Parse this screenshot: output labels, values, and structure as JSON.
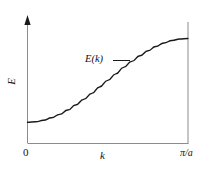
{
  "figure": {
    "kind": "dispersion-curve",
    "background_color": "#ffffff",
    "line_color": "#1a1a1a",
    "axis_color": "#808080"
  },
  "labels": {
    "y_axis": "E",
    "x_axis": "k",
    "origin": "0",
    "x_max": "π/a",
    "curve_annotation": "E(k)"
  },
  "chart_data": {
    "type": "line",
    "title": "",
    "xlabel": "k",
    "ylabel": "E",
    "xlim": [
      0,
      3.14159
    ],
    "ylim": [
      0,
      1
    ],
    "xtick_labels": [
      "0",
      "π/a"
    ],
    "ytick_labels": [],
    "grid": false,
    "legend": null,
    "annotations": [
      {
        "text": "E(k)",
        "x": 1.75,
        "y": 0.62,
        "leader_line": true
      }
    ],
    "series": [
      {
        "name": "E(k)",
        "description": "Monotonic sigmoidal (cosine-band) dispersion from band bottom at k=0 to band top at k=π/a",
        "x": [
          0.0,
          0.16,
          0.31,
          0.47,
          0.63,
          0.79,
          0.94,
          1.1,
          1.26,
          1.41,
          1.57,
          1.73,
          1.88,
          2.04,
          2.2,
          2.36,
          2.51,
          2.67,
          2.83,
          2.98,
          3.14
        ],
        "y": [
          0.0,
          0.006,
          0.024,
          0.054,
          0.095,
          0.146,
          0.206,
          0.273,
          0.345,
          0.422,
          0.5,
          0.578,
          0.655,
          0.727,
          0.794,
          0.854,
          0.905,
          0.946,
          0.976,
          0.994,
          1.0
        ]
      }
    ]
  }
}
